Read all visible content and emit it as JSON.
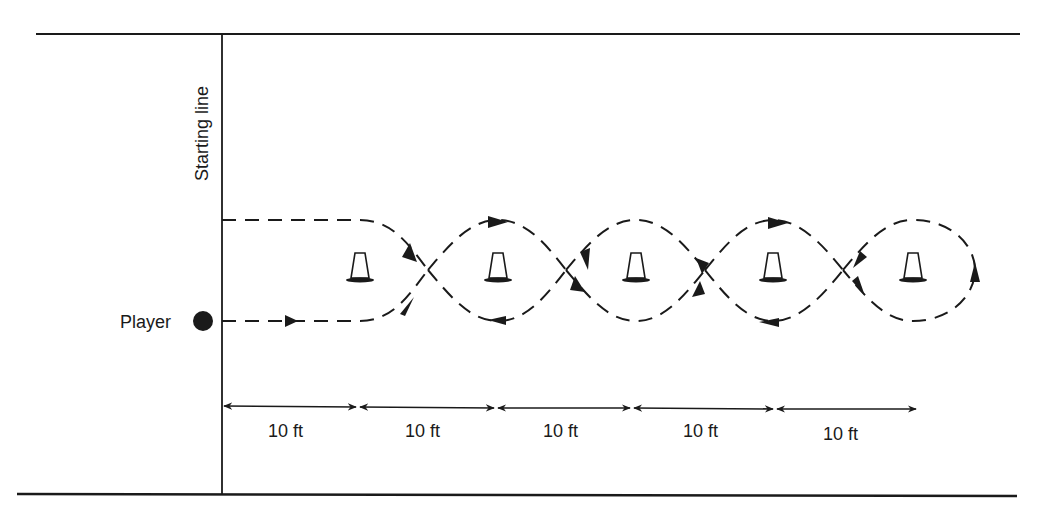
{
  "diagram": {
    "starting_line_label": "Starting line",
    "player_label": "Player",
    "distance_labels": [
      "10 ft",
      "10 ft",
      "10 ft",
      "10 ft",
      "10 ft"
    ],
    "cone_count": 5,
    "colors": {
      "ink": "#1a1a1a",
      "background": "#ffffff"
    }
  }
}
